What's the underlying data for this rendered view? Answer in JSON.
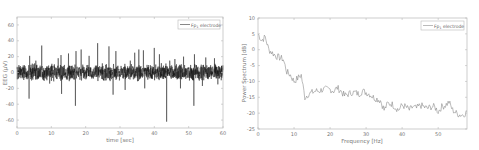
{
  "chart_data": [
    {
      "type": "line",
      "title": "",
      "xlabel": "time [sec]",
      "ylabel": "EEG (μV)",
      "xlim": [
        0,
        60
      ],
      "ylim": [
        -70,
        70
      ],
      "xticks": [
        0,
        10,
        20,
        30,
        40,
        50,
        60
      ],
      "yticks": [
        60,
        40,
        20,
        0,
        -20,
        -40,
        -60
      ],
      "xtick_labels": [
        "0",
        "10",
        "20",
        "30",
        "40",
        "50",
        "60"
      ],
      "ytick_labels": [
        "60",
        "40",
        "20",
        "0",
        "-20",
        "-40",
        "-60"
      ],
      "grid": false,
      "legend": {
        "position": "top-right",
        "entries": [
          "Fp1 electrode"
        ]
      },
      "series": [
        {
          "name": "Fp1 electrode",
          "description": "EEG noise band roughly ±10 μV with transient spikes",
          "baseline_band": [
            -10,
            10
          ],
          "spikes": [
            {
              "x": 3.5,
              "y": -33
            },
            {
              "x": 3.7,
              "y": 21
            },
            {
              "x": 5.5,
              "y": 15
            },
            {
              "x": 7.2,
              "y": 34
            },
            {
              "x": 9.5,
              "y": -14
            },
            {
              "x": 12.0,
              "y": 18
            },
            {
              "x": 12.8,
              "y": 22
            },
            {
              "x": 13.0,
              "y": -27
            },
            {
              "x": 15.0,
              "y": 24
            },
            {
              "x": 17.0,
              "y": -42
            },
            {
              "x": 17.2,
              "y": 27
            },
            {
              "x": 18.7,
              "y": 29
            },
            {
              "x": 21.0,
              "y": 21
            },
            {
              "x": 23.5,
              "y": 37
            },
            {
              "x": 26.8,
              "y": 33
            },
            {
              "x": 28.0,
              "y": -28
            },
            {
              "x": 28.8,
              "y": 27
            },
            {
              "x": 31.5,
              "y": -22
            },
            {
              "x": 33.0,
              "y": 15
            },
            {
              "x": 34.3,
              "y": 25
            },
            {
              "x": 35.5,
              "y": 29
            },
            {
              "x": 36.8,
              "y": 28
            },
            {
              "x": 37.2,
              "y": -20
            },
            {
              "x": 40.0,
              "y": 31
            },
            {
              "x": 41.5,
              "y": 23
            },
            {
              "x": 43.6,
              "y": -62
            },
            {
              "x": 44.5,
              "y": 15
            },
            {
              "x": 46.0,
              "y": 17
            },
            {
              "x": 47.6,
              "y": -20
            },
            {
              "x": 48.5,
              "y": 20
            },
            {
              "x": 51.5,
              "y": -42
            },
            {
              "x": 51.7,
              "y": 23
            },
            {
              "x": 54.0,
              "y": -17
            },
            {
              "x": 55.0,
              "y": 19
            },
            {
              "x": 57.5,
              "y": 18
            },
            {
              "x": 58.5,
              "y": -15
            }
          ]
        }
      ]
    },
    {
      "type": "line",
      "title": "",
      "xlabel": "Frequency [Hz]",
      "ylabel": "Power Spectrum [dB]",
      "xlim": [
        0,
        58
      ],
      "ylim": [
        -25,
        10
      ],
      "xticks": [
        0,
        10,
        20,
        30,
        40,
        50
      ],
      "yticks": [
        10,
        5,
        0,
        -5,
        -10,
        -15,
        -20,
        -25
      ],
      "xtick_labels": [
        "0",
        "10",
        "20",
        "30",
        "40",
        "50"
      ],
      "ytick_labels": [
        "10",
        "5",
        "0",
        "-5",
        "-10",
        "-15",
        "-20",
        "-25"
      ],
      "grid": false,
      "legend": {
        "position": "top-right",
        "entries": [
          "Fp1 electrode"
        ]
      },
      "series": [
        {
          "name": "Fp1 electrode",
          "x": [
            0,
            1,
            2,
            3,
            4,
            5,
            6,
            7,
            8,
            9,
            10,
            11,
            12,
            13,
            14,
            15,
            16,
            17,
            18,
            19,
            20,
            21,
            22,
            23,
            24,
            25,
            26,
            27,
            28,
            29,
            30,
            31,
            32,
            33,
            34,
            35,
            36,
            37,
            38,
            39,
            40,
            41,
            42,
            43,
            44,
            45,
            46,
            47,
            48,
            49,
            50,
            51,
            52,
            53,
            54,
            55,
            56,
            57,
            58
          ],
          "y": [
            5,
            3,
            4,
            0,
            -1,
            -2,
            -2.5,
            -3,
            -7,
            -8,
            -10,
            -9,
            -8,
            -15,
            -14,
            -13.5,
            -13,
            -13,
            -12.5,
            -12.5,
            -12.5,
            -13,
            -12,
            -13,
            -14.5,
            -14,
            -13.5,
            -13.5,
            -14,
            -13,
            -13.5,
            -14,
            -15,
            -15.5,
            -16,
            -19,
            -17,
            -17,
            -18,
            -19,
            -17.5,
            -18,
            -19,
            -18,
            -18.5,
            -17.5,
            -18,
            -18.5,
            -18,
            -18,
            -19.5,
            -18,
            -17.5,
            -16.5,
            -19,
            -20,
            -20.5,
            -20.5,
            -19.5
          ]
        }
      ]
    }
  ],
  "legend_label_main": "Fp",
  "legend_label_sub": "1",
  "legend_label_rest": " electrode"
}
